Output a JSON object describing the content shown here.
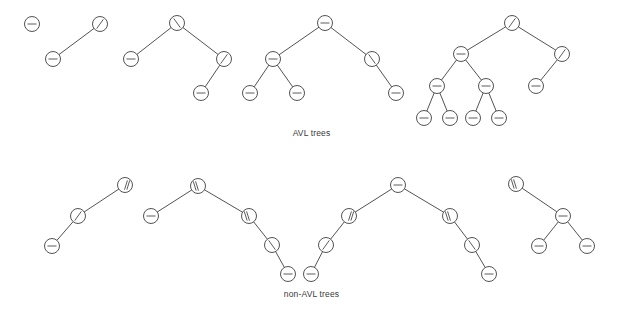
{
  "figure": {
    "title_top": "AVL trees",
    "title_bottom": "non-AVL trees",
    "node_radius": 7.5,
    "colors": {
      "stroke": "#3f3f3f",
      "node_fill": "#ffffff",
      "glyph": "#4a4a4a",
      "caption": "#3a3a3a",
      "background": "#ffffff"
    },
    "glyph_legend": {
      "dash": "balanced (height difference 0)",
      "slash": "left-heavy (height difference +1)",
      "backslash": "right-heavy (height difference -1)",
      "double-slash": "left-heavy by 2 (AVL violation)",
      "double-backslash": "right-heavy by 2 (AVL violation)"
    },
    "rows": [
      {
        "label": "AVL trees",
        "name": "avl-row",
        "trees": [
          {
            "name": "avl-tree-1",
            "nodes": [
              {
                "id": "a1n1",
                "x": 32,
                "y": 24,
                "glyph": "dash"
              }
            ],
            "edges": []
          },
          {
            "name": "avl-tree-2",
            "nodes": [
              {
                "id": "a2n1",
                "x": 100,
                "y": 24,
                "glyph": "slash"
              },
              {
                "id": "a2n2",
                "x": 53,
                "y": 59,
                "glyph": "dash"
              }
            ],
            "edges": [
              {
                "from": "a2n1",
                "to": "a2n2"
              }
            ]
          },
          {
            "name": "avl-tree-3",
            "nodes": [
              {
                "id": "a3n1",
                "x": 177,
                "y": 23,
                "glyph": "backslash"
              },
              {
                "id": "a3n2",
                "x": 131,
                "y": 59,
                "glyph": "dash"
              },
              {
                "id": "a3n3",
                "x": 224,
                "y": 59,
                "glyph": "slash"
              },
              {
                "id": "a3n4",
                "x": 201,
                "y": 93,
                "glyph": "dash"
              }
            ],
            "edges": [
              {
                "from": "a3n1",
                "to": "a3n2"
              },
              {
                "from": "a3n1",
                "to": "a3n3"
              },
              {
                "from": "a3n3",
                "to": "a3n4"
              }
            ]
          },
          {
            "name": "avl-tree-4",
            "nodes": [
              {
                "id": "a4n1",
                "x": 325,
                "y": 23,
                "glyph": "dash"
              },
              {
                "id": "a4n2",
                "x": 273,
                "y": 59,
                "glyph": "dash"
              },
              {
                "id": "a4n3",
                "x": 250,
                "y": 93,
                "glyph": "dash"
              },
              {
                "id": "a4n4",
                "x": 297,
                "y": 93,
                "glyph": "dash"
              },
              {
                "id": "a4n5",
                "x": 372,
                "y": 59,
                "glyph": "backslash"
              },
              {
                "id": "a4n6",
                "x": 396,
                "y": 93,
                "glyph": "dash"
              }
            ],
            "edges": [
              {
                "from": "a4n1",
                "to": "a4n2"
              },
              {
                "from": "a4n1",
                "to": "a4n5"
              },
              {
                "from": "a4n2",
                "to": "a4n3"
              },
              {
                "from": "a4n2",
                "to": "a4n4"
              },
              {
                "from": "a4n5",
                "to": "a4n6"
              }
            ]
          },
          {
            "name": "avl-tree-5",
            "nodes": [
              {
                "id": "a5n1",
                "x": 512,
                "y": 23,
                "glyph": "slash"
              },
              {
                "id": "a5n2",
                "x": 461,
                "y": 54,
                "glyph": "dash"
              },
              {
                "id": "a5n3",
                "x": 437,
                "y": 86,
                "glyph": "dash"
              },
              {
                "id": "a5n4",
                "x": 424,
                "y": 118,
                "glyph": "dash"
              },
              {
                "id": "a5n5",
                "x": 450,
                "y": 118,
                "glyph": "dash"
              },
              {
                "id": "a5n6",
                "x": 486,
                "y": 86,
                "glyph": "dash"
              },
              {
                "id": "a5n7",
                "x": 473,
                "y": 118,
                "glyph": "dash"
              },
              {
                "id": "a5n8",
                "x": 499,
                "y": 118,
                "glyph": "dash"
              },
              {
                "id": "a5n9",
                "x": 562,
                "y": 54,
                "glyph": "slash"
              },
              {
                "id": "a5n10",
                "x": 536,
                "y": 86,
                "glyph": "dash"
              }
            ],
            "edges": [
              {
                "from": "a5n1",
                "to": "a5n2"
              },
              {
                "from": "a5n1",
                "to": "a5n9"
              },
              {
                "from": "a5n2",
                "to": "a5n3"
              },
              {
                "from": "a5n2",
                "to": "a5n6"
              },
              {
                "from": "a5n3",
                "to": "a5n4"
              },
              {
                "from": "a5n3",
                "to": "a5n5"
              },
              {
                "from": "a5n6",
                "to": "a5n7"
              },
              {
                "from": "a5n6",
                "to": "a5n8"
              },
              {
                "from": "a5n9",
                "to": "a5n10"
              }
            ]
          }
        ]
      },
      {
        "label": "non-AVL trees",
        "name": "non-avl-row",
        "trees": [
          {
            "name": "nonavl-tree-1",
            "nodes": [
              {
                "id": "b1n1",
                "x": 125,
                "y": 185,
                "glyph": "double-slash"
              },
              {
                "id": "b1n2",
                "x": 78,
                "y": 216,
                "glyph": "slash"
              },
              {
                "id": "b1n3",
                "x": 52,
                "y": 246,
                "glyph": "dash"
              }
            ],
            "edges": [
              {
                "from": "b1n1",
                "to": "b1n2"
              },
              {
                "from": "b1n2",
                "to": "b1n3"
              }
            ]
          },
          {
            "name": "nonavl-tree-2",
            "nodes": [
              {
                "id": "b2n1",
                "x": 198,
                "y": 186,
                "glyph": "double-backslash"
              },
              {
                "id": "b2n2",
                "x": 151,
                "y": 216,
                "glyph": "dash"
              },
              {
                "id": "b2n3",
                "x": 249,
                "y": 216,
                "glyph": "double-backslash"
              },
              {
                "id": "b2n4",
                "x": 272,
                "y": 245,
                "glyph": "backslash"
              },
              {
                "id": "b2n5",
                "x": 288,
                "y": 274,
                "glyph": "dash"
              }
            ],
            "edges": [
              {
                "from": "b2n1",
                "to": "b2n2"
              },
              {
                "from": "b2n1",
                "to": "b2n3"
              },
              {
                "from": "b2n3",
                "to": "b2n4"
              },
              {
                "from": "b2n4",
                "to": "b2n5"
              }
            ]
          },
          {
            "name": "nonavl-tree-3",
            "nodes": [
              {
                "id": "b3n1",
                "x": 398,
                "y": 185,
                "glyph": "dash"
              },
              {
                "id": "b3n2",
                "x": 349,
                "y": 216,
                "glyph": "double-slash"
              },
              {
                "id": "b3n3",
                "x": 326,
                "y": 245,
                "glyph": "slash"
              },
              {
                "id": "b3n4",
                "x": 311,
                "y": 274,
                "glyph": "dash"
              },
              {
                "id": "b3n5",
                "x": 450,
                "y": 216,
                "glyph": "double-backslash"
              },
              {
                "id": "b3n6",
                "x": 472,
                "y": 245,
                "glyph": "backslash"
              },
              {
                "id": "b3n7",
                "x": 489,
                "y": 274,
                "glyph": "dash"
              }
            ],
            "edges": [
              {
                "from": "b3n1",
                "to": "b3n2"
              },
              {
                "from": "b3n1",
                "to": "b3n5"
              },
              {
                "from": "b3n2",
                "to": "b3n3"
              },
              {
                "from": "b3n3",
                "to": "b3n4"
              },
              {
                "from": "b3n5",
                "to": "b3n6"
              },
              {
                "from": "b3n6",
                "to": "b3n7"
              }
            ]
          },
          {
            "name": "nonavl-tree-4",
            "nodes": [
              {
                "id": "b4n1",
                "x": 516,
                "y": 184,
                "glyph": "double-backslash"
              },
              {
                "id": "b4n2",
                "x": 563,
                "y": 216,
                "glyph": "dash"
              },
              {
                "id": "b4n3",
                "x": 539,
                "y": 246,
                "glyph": "dash"
              },
              {
                "id": "b4n4",
                "x": 587,
                "y": 246,
                "glyph": "dash"
              }
            ],
            "edges": [
              {
                "from": "b4n1",
                "to": "b4n2"
              },
              {
                "from": "b4n2",
                "to": "b4n3"
              },
              {
                "from": "b4n2",
                "to": "b4n4"
              }
            ]
          }
        ]
      }
    ]
  }
}
